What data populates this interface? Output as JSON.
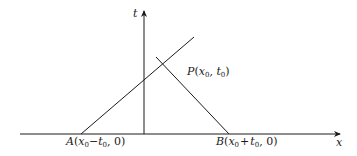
{
  "diagram": {
    "type": "characteristics-domain-of-dependence",
    "axes": {
      "horizontal_label": "x",
      "vertical_label": "t"
    },
    "points": {
      "A": {
        "name": "A",
        "coords_text": "(x0−t0, 0)",
        "x_main": "x",
        "x_sub": "0",
        "minus": "−",
        "t_main": "t",
        "t_sub": "0",
        "tail": ", 0)"
      },
      "B": {
        "name": "B",
        "coords_text": "(x0+t0, 0)",
        "x_main": "x",
        "x_sub": "0",
        "plus": "+",
        "t_main": "t",
        "t_sub": "0",
        "tail": ", 0)"
      },
      "P": {
        "name": "P",
        "coords_text": "(x0, t0)",
        "x_main": "x",
        "x_sub": "0",
        "t_main": "t",
        "t_sub": "0"
      }
    },
    "colors": {
      "line": "#1a1a1a",
      "background": "#ffffff"
    }
  }
}
